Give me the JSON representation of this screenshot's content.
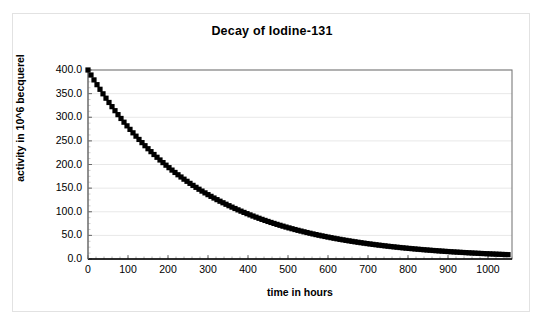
{
  "chart_data": {
    "type": "scatter",
    "title": "Decay of Iodine-131",
    "xlabel": "time in hours",
    "ylabel": "activity in 10^6 becquerel",
    "xlim": [
      0,
      1060
    ],
    "ylim": [
      0,
      400
    ],
    "xticks": [
      0,
      100,
      200,
      300,
      400,
      500,
      600,
      700,
      800,
      900,
      1000
    ],
    "xtick_labels": [
      "0",
      "100",
      "200",
      "300",
      "400",
      "500",
      "600",
      "700",
      "800",
      "900",
      "1000"
    ],
    "yticks": [
      0,
      50,
      100,
      150,
      200,
      250,
      300,
      350,
      400
    ],
    "ytick_labels": [
      "0.0",
      "50.0",
      "100.0",
      "150.0",
      "200.0",
      "250.0",
      "300.0",
      "350.0",
      "400.0"
    ],
    "grid": "horizontal",
    "legend": "none",
    "marker": "black-square",
    "marker_size": 2.6,
    "initial_activity": 400.0,
    "half_life_hours": 193,
    "x_step_hours": 15,
    "series": [
      {
        "name": "activity",
        "color": "#000000",
        "x": [
          0,
          15,
          30,
          45,
          60,
          75,
          90,
          105,
          120,
          135,
          150,
          165,
          180,
          195,
          210,
          225,
          240,
          255,
          270,
          285,
          300,
          315,
          330,
          345,
          360,
          375,
          390,
          405,
          420,
          435,
          450,
          465,
          480,
          495,
          510,
          525,
          540,
          555,
          570,
          585,
          600,
          615,
          630,
          645,
          660,
          675,
          690,
          705,
          720,
          735,
          750,
          765,
          780,
          795,
          810,
          825,
          840,
          855,
          870,
          885,
          900,
          915,
          930,
          945,
          960,
          975,
          990,
          1005,
          1020,
          1035,
          1050
        ],
        "y": [
          400.0,
          379.1,
          359.3,
          340.5,
          322.7,
          305.8,
          289.9,
          274.7,
          260.4,
          246.8,
          233.9,
          221.7,
          210.1,
          199.1,
          188.7,
          178.9,
          169.5,
          160.7,
          152.3,
          144.3,
          136.8,
          129.6,
          122.9,
          116.5,
          110.4,
          104.6,
          99.2,
          94.0,
          89.1,
          84.4,
          80.0,
          75.8,
          71.9,
          68.1,
          64.6,
          61.2,
          58.0,
          55.0,
          52.1,
          49.4,
          46.8,
          44.4,
          42.1,
          39.9,
          37.8,
          35.8,
          33.9,
          32.2,
          30.5,
          28.9,
          27.4,
          25.9,
          24.6,
          23.3,
          22.1,
          20.9,
          19.8,
          18.8,
          17.8,
          16.9,
          16.0,
          15.2,
          14.4,
          13.6,
          12.9,
          12.2,
          11.6,
          11.0,
          10.4,
          9.9,
          9.4
        ]
      }
    ]
  }
}
